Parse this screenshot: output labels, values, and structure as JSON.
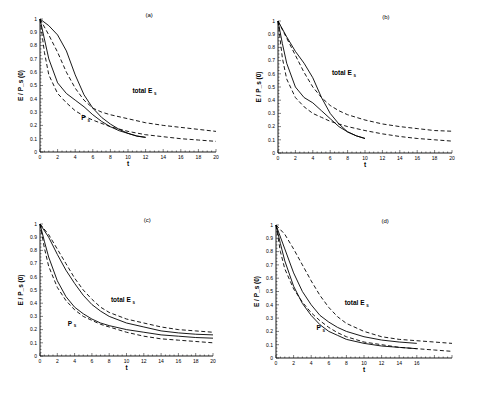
{
  "figure": {
    "background": "#ffffff",
    "line_color": "#000000"
  },
  "chart_data": [
    {
      "type": "line",
      "panel": "(a)",
      "xlabel": "t",
      "ylabel": "E / P_s (0)",
      "xlim": [
        0,
        20
      ],
      "ylim": [
        0,
        1
      ],
      "xticks": [
        "0",
        "2",
        "4",
        "6",
        "8",
        "10",
        "12",
        "14",
        "16",
        "18",
        "20"
      ],
      "yticks": [
        "0",
        "0.1",
        "0.2",
        "0.3",
        "0.4",
        "0.5",
        "0.6",
        "0.7",
        "0.8",
        "0.9",
        "1"
      ],
      "annotations": [
        {
          "text": "total E",
          "sub": "s",
          "x": 10.5,
          "y": 0.44
        },
        {
          "text": "P",
          "sub": "s",
          "x": 4.7,
          "y": 0.24
        }
      ],
      "series": [
        {
          "name": "total E_s (solid)",
          "style": "solid",
          "x": [
            0,
            1,
            2,
            3,
            4,
            5,
            6,
            7,
            8,
            9,
            10,
            11,
            12
          ],
          "y": [
            1.0,
            0.95,
            0.88,
            0.76,
            0.58,
            0.43,
            0.33,
            0.26,
            0.21,
            0.17,
            0.14,
            0.12,
            0.11
          ]
        },
        {
          "name": "total E_s (dashed)",
          "style": "dashed",
          "x": [
            0,
            1,
            2,
            3,
            4,
            5,
            6,
            7,
            8,
            10,
            12,
            14,
            16,
            18,
            20
          ],
          "y": [
            1.0,
            0.88,
            0.75,
            0.6,
            0.48,
            0.39,
            0.33,
            0.3,
            0.28,
            0.25,
            0.22,
            0.2,
            0.185,
            0.17,
            0.155
          ]
        },
        {
          "name": "P_s (solid)",
          "style": "solid",
          "x": [
            0,
            0.5,
            1,
            2,
            3,
            4,
            5,
            6,
            7,
            8,
            9,
            10,
            11,
            12
          ],
          "y": [
            1.0,
            0.85,
            0.7,
            0.52,
            0.44,
            0.39,
            0.34,
            0.28,
            0.23,
            0.19,
            0.16,
            0.14,
            0.12,
            0.11
          ]
        },
        {
          "name": "P_s (dashed)",
          "style": "dashed",
          "x": [
            0,
            0.5,
            1,
            2,
            3,
            4,
            5,
            6,
            8,
            10,
            12,
            14,
            16,
            18,
            20
          ],
          "y": [
            1.0,
            0.75,
            0.58,
            0.44,
            0.37,
            0.31,
            0.27,
            0.24,
            0.19,
            0.155,
            0.13,
            0.115,
            0.1,
            0.09,
            0.08
          ]
        }
      ]
    },
    {
      "type": "line",
      "panel": "(b)",
      "xlabel": "t",
      "ylabel": "E / P_s (0)",
      "xlim": [
        0,
        20
      ],
      "ylim": [
        0,
        1
      ],
      "xticks": [
        "0",
        "2",
        "4",
        "6",
        "8",
        "10",
        "12",
        "14",
        "16",
        "18",
        "20"
      ],
      "yticks": [
        "0",
        "0.1",
        "0.2",
        "0.3",
        "0.4",
        "0.5",
        "0.6",
        "0.7",
        "0.8",
        "0.9",
        "1"
      ],
      "annotations": [
        {
          "text": "total E",
          "sub": "s",
          "x": 6.2,
          "y": 0.59
        }
      ],
      "series": [
        {
          "name": "total E_s (solid)",
          "style": "solid",
          "x": [
            0,
            1,
            2,
            3,
            4,
            5,
            6,
            7,
            8,
            9,
            10
          ],
          "y": [
            1.0,
            0.88,
            0.77,
            0.68,
            0.57,
            0.42,
            0.3,
            0.22,
            0.16,
            0.13,
            0.11
          ]
        },
        {
          "name": "total E_s (dashed)",
          "style": "dashed",
          "x": [
            0,
            1,
            2,
            3,
            4,
            5,
            6,
            7,
            8,
            10,
            12,
            14,
            16,
            18,
            20
          ],
          "y": [
            1.0,
            0.87,
            0.74,
            0.61,
            0.5,
            0.42,
            0.36,
            0.32,
            0.29,
            0.25,
            0.22,
            0.2,
            0.185,
            0.17,
            0.165
          ]
        },
        {
          "name": "P_s (solid)",
          "style": "solid",
          "x": [
            0,
            0.5,
            1,
            2,
            3,
            4,
            5,
            6,
            7,
            8,
            9,
            10
          ],
          "y": [
            1.0,
            0.83,
            0.68,
            0.5,
            0.42,
            0.38,
            0.32,
            0.26,
            0.2,
            0.16,
            0.13,
            0.11
          ]
        },
        {
          "name": "P_s (dashed)",
          "style": "dashed",
          "x": [
            0,
            0.5,
            1,
            2,
            3,
            4,
            5,
            6,
            8,
            10,
            12,
            14,
            16,
            18,
            20
          ],
          "y": [
            1.0,
            0.72,
            0.56,
            0.42,
            0.35,
            0.3,
            0.27,
            0.24,
            0.2,
            0.17,
            0.145,
            0.125,
            0.11,
            0.1,
            0.09
          ]
        }
      ]
    },
    {
      "type": "line",
      "panel": "(c)",
      "xlabel": "t",
      "ylabel": "E / P_s (0)",
      "xlim": [
        0,
        20
      ],
      "ylim": [
        0,
        1
      ],
      "xticks": [
        "0",
        "2",
        "4",
        "6",
        "8",
        "10",
        "12",
        "14",
        "16",
        "18",
        "20"
      ],
      "yticks": [
        "0",
        "0.1",
        "0.2",
        "0.3",
        "0.4",
        "0.5",
        "0.6",
        "0.7",
        "0.8",
        "0.9",
        "1"
      ],
      "annotations": [
        {
          "text": "total E",
          "sub": "s",
          "x": 8.2,
          "y": 0.41
        },
        {
          "text": "P",
          "sub": "s",
          "x": 3.2,
          "y": 0.23
        }
      ],
      "series": [
        {
          "name": "total E_s (solid)",
          "style": "solid",
          "x": [
            0,
            1,
            2,
            3,
            4,
            5,
            6,
            7,
            8,
            10,
            12,
            14,
            16,
            18,
            20
          ],
          "y": [
            1.0,
            0.9,
            0.77,
            0.65,
            0.55,
            0.46,
            0.39,
            0.34,
            0.3,
            0.25,
            0.22,
            0.19,
            0.175,
            0.165,
            0.16
          ]
        },
        {
          "name": "total E_s (dashed)",
          "style": "dashed",
          "x": [
            0,
            1,
            2,
            3,
            4,
            5,
            6,
            7,
            8,
            10,
            12,
            14,
            16,
            18,
            20
          ],
          "y": [
            1.0,
            0.92,
            0.81,
            0.7,
            0.59,
            0.5,
            0.43,
            0.37,
            0.33,
            0.28,
            0.25,
            0.22,
            0.2,
            0.19,
            0.18
          ]
        },
        {
          "name": "P_s (solid)",
          "style": "solid",
          "x": [
            0,
            0.5,
            1,
            2,
            3,
            4,
            5,
            6,
            7,
            8,
            10,
            12,
            14,
            16,
            18,
            20
          ],
          "y": [
            1.0,
            0.87,
            0.75,
            0.57,
            0.45,
            0.37,
            0.32,
            0.28,
            0.25,
            0.23,
            0.2,
            0.18,
            0.16,
            0.15,
            0.14,
            0.135
          ]
        },
        {
          "name": "P_s (dashed)",
          "style": "dashed",
          "x": [
            0,
            0.5,
            1,
            2,
            3,
            4,
            5,
            6,
            7,
            8,
            10,
            12,
            14,
            16,
            18,
            20
          ],
          "y": [
            1.0,
            0.82,
            0.68,
            0.52,
            0.42,
            0.35,
            0.3,
            0.27,
            0.24,
            0.22,
            0.18,
            0.15,
            0.13,
            0.12,
            0.11,
            0.1
          ]
        }
      ]
    },
    {
      "type": "line",
      "panel": "(d)",
      "xlabel": "t",
      "ylabel": "E / P_s (0)",
      "xlim": [
        0,
        20
      ],
      "ylim": [
        0,
        1
      ],
      "xticks": [
        "0",
        "2",
        "4",
        "6",
        "8",
        "10",
        "12",
        "14",
        "16"
      ],
      "yticks": [
        "0",
        "0.1",
        "0.2",
        "0.3",
        "0.4",
        "0.5",
        "0.6",
        "0.7",
        "0.8",
        "0.9",
        "1"
      ],
      "annotations": [
        {
          "text": "total E",
          "sub": "s",
          "x": 7.8,
          "y": 0.4
        },
        {
          "text": "P",
          "sub": "s",
          "x": 4.6,
          "y": 0.21
        }
      ],
      "series": [
        {
          "name": "total E_s (solid)",
          "style": "solid",
          "x": [
            0,
            1,
            2,
            3,
            4,
            5,
            6,
            7,
            8,
            10,
            12,
            14,
            16
          ],
          "y": [
            1.0,
            0.82,
            0.64,
            0.5,
            0.4,
            0.32,
            0.27,
            0.23,
            0.2,
            0.16,
            0.135,
            0.12,
            0.11
          ]
        },
        {
          "name": "total E_s (dashed)",
          "style": "dashed",
          "x": [
            0,
            1,
            2,
            3,
            4,
            5,
            6,
            7,
            8,
            10,
            12,
            14,
            16,
            18,
            20
          ],
          "y": [
            1.0,
            0.93,
            0.82,
            0.7,
            0.58,
            0.47,
            0.38,
            0.31,
            0.26,
            0.2,
            0.16,
            0.14,
            0.13,
            0.12,
            0.11
          ]
        },
        {
          "name": "P_s (solid)",
          "style": "solid",
          "x": [
            0,
            0.5,
            1,
            2,
            3,
            4,
            5,
            6,
            7,
            8,
            10,
            12,
            14,
            16
          ],
          "y": [
            1.0,
            0.86,
            0.73,
            0.54,
            0.41,
            0.32,
            0.25,
            0.2,
            0.17,
            0.14,
            0.11,
            0.09,
            0.08,
            0.07
          ]
        },
        {
          "name": "P_s (dashed)",
          "style": "dashed",
          "x": [
            0,
            0.5,
            1,
            2,
            3,
            4,
            5,
            6,
            7,
            8,
            10,
            12,
            14,
            16,
            18,
            20
          ],
          "y": [
            1.0,
            0.8,
            0.67,
            0.52,
            0.42,
            0.34,
            0.28,
            0.23,
            0.19,
            0.16,
            0.12,
            0.1,
            0.08,
            0.07,
            0.06,
            0.05
          ]
        }
      ]
    }
  ],
  "layout": [
    {
      "x0": 40,
      "x1": 216,
      "y0": 152,
      "y1": 19,
      "xmaxTick": 20,
      "axisEnd": 20
    },
    {
      "x0": 278,
      "x1": 452,
      "y0": 153,
      "y1": 21,
      "xmaxTick": 20,
      "axisEnd": 20
    },
    {
      "x0": 40,
      "x1": 213,
      "y0": 356,
      "y1": 224,
      "xmaxTick": 20,
      "axisEnd": 20
    },
    {
      "x0": 276,
      "x1": 452,
      "y0": 358,
      "y1": 225,
      "xmaxTick": 16,
      "axisEnd": 20
    }
  ]
}
